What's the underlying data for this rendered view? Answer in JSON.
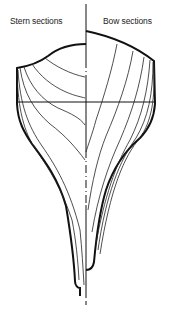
{
  "diagram": {
    "labels": {
      "stern": "Stern sections",
      "bow": "Bow sections"
    },
    "colors": {
      "line": "#111111",
      "background": "#ffffff"
    },
    "elements": {
      "centerline": "dash-dot vertical centreline",
      "waterline": "horizontal waterline",
      "stern_section_count": 6,
      "bow_section_count": 6
    }
  }
}
